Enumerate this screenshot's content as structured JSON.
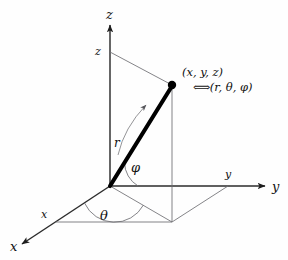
{
  "figure": {
    "background_color": "#fefefe",
    "line_color": "#4a4a4a",
    "axis_color": "#2b2b2b",
    "vector_color": "#000000",
    "text_color": "#101010"
  },
  "axes": {
    "z_tip_label": "z",
    "y_tip_label": "y",
    "x_tip_label": "x",
    "z_height_label": "z",
    "y_proj_label": "y",
    "x_proj_label": "x"
  },
  "angles": {
    "theta_label": "θ",
    "phi_label": "φ",
    "radius_label": "r"
  },
  "annotation": {
    "cartesian": "(x, y, z)",
    "equiv_glyph": "⟺",
    "spherical": "(r, θ, φ)"
  },
  "geometry": {
    "origin": [
      110,
      186
    ],
    "point": [
      172,
      85
    ],
    "xy_projection": [
      172,
      222
    ],
    "z_height_point": [
      110,
      52
    ],
    "z_axis_tip": [
      110,
      22
    ],
    "y_axis_tip": [
      268,
      186
    ],
    "x_axis_tip": [
      18,
      247
    ],
    "y_proj_foot": [
      228,
      186
    ],
    "x_proj_foot": [
      56,
      222
    ]
  }
}
